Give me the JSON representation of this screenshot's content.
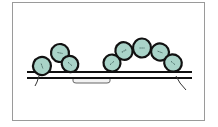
{
  "diagram": {
    "type": "nucleosome-fiber-schematic",
    "colors": {
      "bead_fill": "#a9d3c8",
      "bead_stroke": "#111111",
      "line": "#111111",
      "frame": "#9a9a9a",
      "linker": "#555555"
    },
    "dna_lines": {
      "x1": 27,
      "x2": 192,
      "top_y": 72,
      "bottom_y": 78
    },
    "clusters": [
      {
        "name": "left-cluster",
        "beads": [
          {
            "cx": 42,
            "cy": 66,
            "rx": 9,
            "ry": 9,
            "angle": 70
          },
          {
            "cx": 60,
            "cy": 53,
            "rx": 9,
            "ry": 9,
            "angle": 10
          },
          {
            "cx": 70,
            "cy": 64,
            "rx": 8.5,
            "ry": 8,
            "angle": 40
          }
        ]
      },
      {
        "name": "right-cluster",
        "beads": [
          {
            "cx": 112,
            "cy": 63,
            "rx": 8.5,
            "ry": 8.5,
            "angle": -40
          },
          {
            "cx": 124,
            "cy": 51,
            "rx": 8.5,
            "ry": 9,
            "angle": -30
          },
          {
            "cx": 142,
            "cy": 48,
            "rx": 9,
            "ry": 9.5,
            "angle": 0
          },
          {
            "cx": 160,
            "cy": 52,
            "rx": 9,
            "ry": 8.5,
            "angle": 20
          },
          {
            "cx": 173,
            "cy": 63,
            "rx": 9,
            "ry": 8.5,
            "angle": 40
          }
        ]
      }
    ],
    "linker": {
      "from_x": 73,
      "to_x": 110,
      "y": 81
    },
    "tails": [
      {
        "name": "left-tail",
        "points": "39,76 37,82 35,86"
      },
      {
        "name": "right-tail",
        "points": "176,76 180,83 186,90"
      }
    ]
  }
}
